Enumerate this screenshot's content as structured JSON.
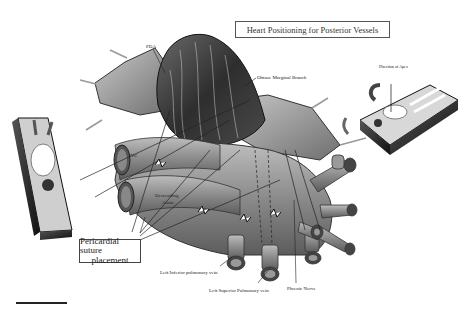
{
  "title": "Heart Positioning for Posterior Vessels",
  "labels": {
    "pda": "PDA",
    "obtuse_marginal": "Obtuse Marginal Branch",
    "direction_of_apex": "Direction of Apex",
    "ivc": "IVC",
    "descending_aorta_line1": "Descending",
    "descending_aorta_line2": "Aorta",
    "pericardial_suture_line1": "Pericardial suture",
    "pericardial_suture_line2": "placement",
    "left_inferior_pulmonary_vein": "Left Inferior pulmonary vein",
    "left_superior_pulmonary_vein": "Left Superior Pulmonary vein",
    "phrenic_nerve": "Phrenic Nerve"
  },
  "colors": {
    "ink": "#222222",
    "heart_dark": "#3a3a3a",
    "heart_mid": "#7a7a7a",
    "vessel": "#8c8c8c",
    "vessel_light": "#b5b5b5",
    "pericardium": "#9a9a9a",
    "background": "#ffffff"
  },
  "insets": {
    "left_patient": "patient-supine-inset-left",
    "right_patient": "patient-supine-inset-right"
  }
}
